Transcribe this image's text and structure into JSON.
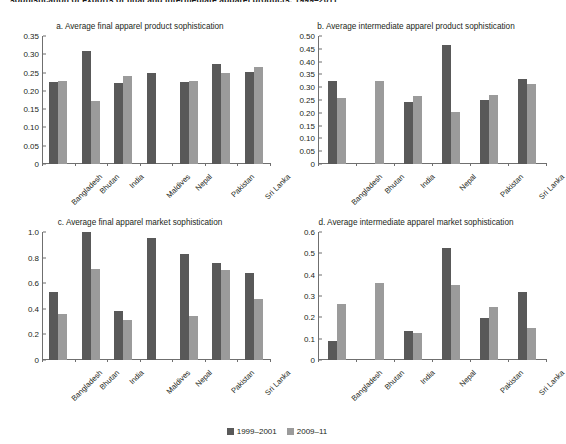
{
  "figure": {
    "supertitle": "sophistication of exports of final and intermediate apparel products, 1999–2011",
    "legend": [
      {
        "label": "1999–2001",
        "color": "#595959"
      },
      {
        "label": "2009–11",
        "color": "#9b9b9b"
      }
    ]
  },
  "chart_data": [
    {
      "type": "bar",
      "panel": "a",
      "title": "a. Average final apparel product sophistication",
      "categories": [
        "Bangladesh",
        "Bhutan",
        "India",
        "Maldives",
        "Nepal",
        "Pakistan",
        "Sri Lanka"
      ],
      "series": [
        {
          "name": "1999–2001",
          "color": "#595959",
          "values": [
            0.223,
            0.31,
            0.222,
            0.248,
            0.224,
            0.273,
            0.251
          ]
        },
        {
          "name": "2009–11",
          "color": "#9b9b9b",
          "values": [
            0.227,
            0.173,
            0.24,
            null,
            0.227,
            0.25,
            0.264
          ]
        }
      ],
      "xlabel": "",
      "ylabel": "",
      "ylim": [
        0,
        0.35
      ],
      "yticks": [
        0,
        0.05,
        0.1,
        0.15,
        0.2,
        0.25,
        0.3,
        0.35
      ],
      "yticklabels": [
        "0",
        "0.05",
        "0.10",
        "0.15",
        "0.20",
        "0.25",
        "0.30",
        "0.35"
      ],
      "grid": false,
      "legend_position": "figure-bottom"
    },
    {
      "type": "bar",
      "panel": "b",
      "title": "b. Average intermediate apparel product sophistication",
      "categories": [
        "Bangladesh",
        "Bhutan",
        "India",
        "Nepal",
        "Pakistan",
        "Sri Lanka"
      ],
      "series": [
        {
          "name": "1999–2001",
          "color": "#595959",
          "values": [
            0.324,
            null,
            0.242,
            0.465,
            0.25,
            0.334
          ]
        },
        {
          "name": "2009–11",
          "color": "#9b9b9b",
          "values": [
            0.257,
            0.323,
            0.266,
            0.202,
            0.268,
            0.311
          ]
        }
      ],
      "xlabel": "",
      "ylabel": "",
      "ylim": [
        0,
        0.5
      ],
      "yticks": [
        0,
        0.05,
        0.1,
        0.15,
        0.2,
        0.25,
        0.3,
        0.35,
        0.4,
        0.45,
        0.5
      ],
      "yticklabels": [
        "0",
        "0.05",
        "0.10",
        "0.15",
        "0.20",
        "0.25",
        "0.30",
        "0.35",
        "0.40",
        "0.45",
        "0.50"
      ],
      "grid": false,
      "legend_position": "figure-bottom"
    },
    {
      "type": "bar",
      "panel": "c",
      "title": "c. Average final apparel market sophistication",
      "categories": [
        "Bangladesh",
        "Bhutan",
        "India",
        "Maldives",
        "Nepal",
        "Pakistan",
        "Sri Lanka"
      ],
      "series": [
        {
          "name": "1999–2001",
          "color": "#595959",
          "values": [
            0.53,
            1.0,
            0.38,
            0.95,
            0.83,
            0.76,
            0.68
          ]
        },
        {
          "name": "2009–11",
          "color": "#9b9b9b",
          "values": [
            0.36,
            0.71,
            0.31,
            null,
            0.34,
            0.7,
            0.48
          ]
        }
      ],
      "xlabel": "",
      "ylabel": "",
      "ylim": [
        0,
        1.0
      ],
      "yticks": [
        0,
        0.2,
        0.4,
        0.6,
        0.8,
        1.0
      ],
      "yticklabels": [
        "0",
        "0.2",
        "0.4",
        "0.6",
        "0.8",
        "1.0"
      ],
      "grid": false,
      "legend_position": "figure-bottom"
    },
    {
      "type": "bar",
      "panel": "d",
      "title": "d. Average intermediate apparel market sophistication",
      "categories": [
        "Bangladesh",
        "Bhutan",
        "India",
        "Nepal",
        "Pakistan",
        "Sri Lanka"
      ],
      "series": [
        {
          "name": "1999–2001",
          "color": "#595959",
          "values": [
            0.089,
            null,
            0.137,
            0.525,
            0.197,
            0.318
          ]
        },
        {
          "name": "2009–11",
          "color": "#9b9b9b",
          "values": [
            0.262,
            0.36,
            0.126,
            0.352,
            0.25,
            0.149
          ]
        }
      ],
      "xlabel": "",
      "ylabel": "",
      "ylim": [
        0,
        0.6
      ],
      "yticks": [
        0,
        0.1,
        0.2,
        0.3,
        0.4,
        0.5,
        0.6
      ],
      "yticklabels": [
        "0",
        "0.1",
        "0.2",
        "0.3",
        "0.4",
        "0.5",
        "0.6"
      ],
      "grid": false,
      "legend_position": "figure-bottom"
    }
  ]
}
